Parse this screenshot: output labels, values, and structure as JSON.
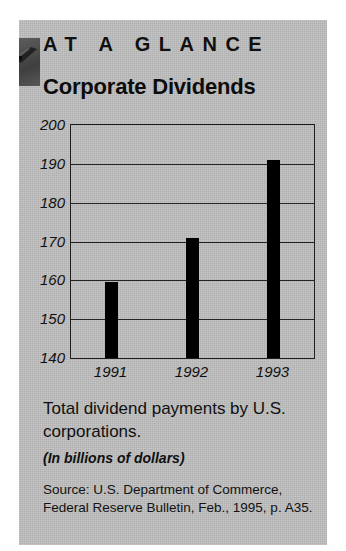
{
  "card": {
    "eyebrow": "AT A GLANCE",
    "title": "Corporate Dividends",
    "caption": "Total dividend payments by U.S. corporations.",
    "units": "(In billions of dollars)",
    "source": "Source: U.S. Department of Commerce, Federal Reserve Bulletin, Feb., 1995, p. A35.",
    "corner_icon": "dog-eared-page-icon",
    "colors": {
      "background": "#bfbfbf",
      "bar": "#000000",
      "ink": "#101010",
      "corner_tab": "#4f4f4f"
    }
  },
  "chart_data": {
    "type": "bar",
    "title": "Corporate Dividends",
    "subtitle": "Total dividend payments by U.S. corporations.",
    "categories": [
      "1991",
      "1992",
      "1993"
    ],
    "values": [
      159.5,
      171,
      191
    ],
    "xlabel": "",
    "ylabel": "",
    "ylim": [
      140,
      200
    ],
    "yticks": [
      200,
      190,
      180,
      170,
      160,
      150,
      140
    ],
    "ytick_labels": [
      "200",
      "190",
      "180",
      "170",
      "160",
      "150",
      "140"
    ],
    "units": "In billions of dollars",
    "grid": true,
    "legend": false,
    "source": "U.S. Department of Commerce, Federal Reserve Bulletin, Feb., 1995, p. A35."
  }
}
